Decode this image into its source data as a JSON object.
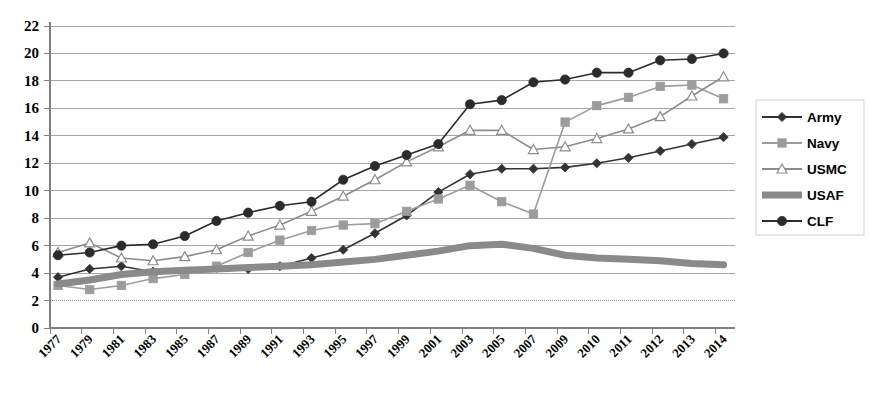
{
  "chart_data": {
    "type": "line",
    "title": "",
    "xlabel": "",
    "ylabel": "",
    "ylim": [
      0,
      22
    ],
    "ytick_step": 2,
    "yticks": [
      "0",
      "2",
      "4",
      "6",
      "8",
      "10",
      "12",
      "14",
      "16",
      "18",
      "20",
      "22"
    ],
    "grid": true,
    "legend_position": "right",
    "categories": [
      "1977",
      "1979",
      "1981",
      "1983",
      "1985",
      "1987",
      "1989",
      "1991",
      "1993",
      "1995",
      "1997",
      "1999",
      "2001",
      "2003",
      "2005",
      "2007",
      "2009",
      "2010",
      "2011",
      "2012",
      "2013",
      "2014"
    ],
    "series": [
      {
        "name": "Army",
        "marker": "diamond",
        "color": "#333333",
        "values": [
          3.7,
          4.3,
          4.5,
          4.1,
          4.0,
          4.4,
          4.3,
          4.5,
          5.1,
          5.7,
          6.9,
          8.2,
          9.9,
          11.2,
          11.6,
          11.6,
          11.7,
          12.0,
          12.4,
          12.9,
          13.4,
          13.9
        ]
      },
      {
        "name": "Navy",
        "marker": "square",
        "color": "#9c9c9c",
        "values": [
          3.1,
          2.8,
          3.1,
          3.6,
          3.9,
          4.5,
          5.5,
          6.4,
          7.1,
          7.5,
          7.6,
          8.5,
          9.4,
          10.4,
          9.2,
          8.3,
          15.0,
          16.2,
          16.8,
          17.6,
          17.7,
          16.7
        ]
      },
      {
        "name": "USMC",
        "marker": "triangle-open",
        "color": "#8c8c8c",
        "values": [
          5.5,
          6.2,
          5.1,
          4.9,
          5.2,
          5.7,
          6.7,
          7.5,
          8.5,
          9.6,
          10.8,
          12.1,
          13.2,
          14.4,
          14.4,
          13.0,
          13.2,
          13.8,
          14.5,
          15.4,
          16.9,
          18.3
        ]
      },
      {
        "name": "USAF",
        "marker": "none",
        "color": "#8a8a8a",
        "values": [
          3.2,
          3.5,
          3.9,
          4.1,
          4.2,
          4.3,
          4.4,
          4.5,
          4.6,
          4.8,
          5.0,
          5.3,
          5.6,
          6.0,
          6.1,
          5.8,
          5.3,
          5.1,
          5.0,
          4.9,
          4.7,
          4.6
        ]
      },
      {
        "name": "CLF",
        "marker": "circle",
        "color": "#2b2b2b",
        "values": [
          5.3,
          5.5,
          6.0,
          6.1,
          6.7,
          7.8,
          8.4,
          8.9,
          9.2,
          10.8,
          11.8,
          12.6,
          13.4,
          16.3,
          16.6,
          17.9,
          18.1,
          18.6,
          18.6,
          19.5,
          19.6,
          20.0
        ]
      }
    ]
  },
  "legend": {
    "items": [
      {
        "label": "Army"
      },
      {
        "label": "Navy"
      },
      {
        "label": "USMC"
      },
      {
        "label": "USAF"
      },
      {
        "label": "CLF"
      }
    ]
  }
}
